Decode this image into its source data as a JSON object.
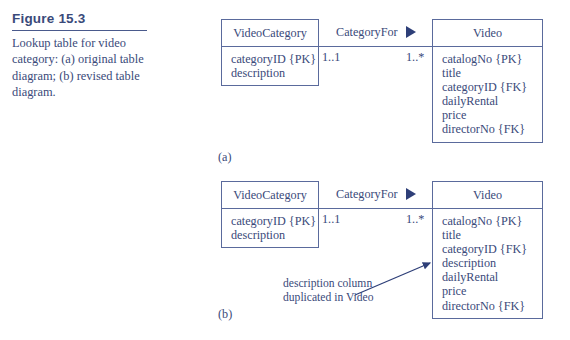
{
  "figure": {
    "heading": "Figure 15.3",
    "caption": "Lookup table for video category: (a) original table diagram; (b) revised table diagram."
  },
  "colors": {
    "ink": "#3a4a7a",
    "stroke": "#5a6a9c",
    "marker": "#2e3f78",
    "background": "#ffffff"
  },
  "diagrams": [
    {
      "id": "a",
      "sub_label": "(a)",
      "left_table": {
        "name": "VideoCategory",
        "attributes": [
          "categoryID {PK}",
          "description"
        ]
      },
      "relationship": {
        "label": "CategoryFor",
        "marker": "filled-triangle-right",
        "left_multiplicity": "1..1",
        "right_multiplicity": "1..*"
      },
      "right_table": {
        "name": "Video",
        "attributes": [
          "catalogNo {PK}",
          "title",
          "categoryID {FK}",
          "dailyRental",
          "price",
          "directorNo {FK}"
        ]
      },
      "annotation": null
    },
    {
      "id": "b",
      "sub_label": "(b)",
      "left_table": {
        "name": "VideoCategory",
        "attributes": [
          "categoryID {PK}",
          "description"
        ]
      },
      "relationship": {
        "label": "CategoryFor",
        "marker": "filled-triangle-right",
        "left_multiplicity": "1..1",
        "right_multiplicity": "1..*"
      },
      "right_table": {
        "name": "Video",
        "attributes": [
          "catalogNo {PK}",
          "title",
          "categoryID {FK}",
          "description",
          "dailyRental",
          "price",
          "directorNo {FK}"
        ]
      },
      "annotation": {
        "line1": "description column",
        "line2": "duplicated in Video",
        "points_to": "description"
      }
    }
  ]
}
